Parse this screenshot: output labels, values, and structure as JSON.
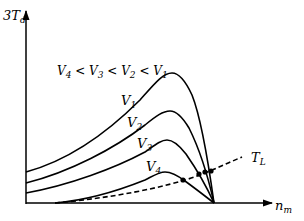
{
  "diagram": {
    "y_axis": {
      "label_main": "3T",
      "label_sub": "d"
    },
    "x_axis": {
      "label_main": "n",
      "label_sub": "m"
    },
    "relation": {
      "parts": [
        "V",
        "4",
        " < ",
        "V",
        "3",
        " < ",
        "V",
        "2",
        " < ",
        "V",
        "1"
      ]
    },
    "curves": [
      {
        "name": "V1",
        "label_main": "V",
        "label_sub": "1",
        "peak_label": "maximum torque highest"
      },
      {
        "name": "V2",
        "label_main": "V",
        "label_sub": "2"
      },
      {
        "name": "V3",
        "label_main": "V",
        "label_sub": "3"
      },
      {
        "name": "V4",
        "label_main": "V",
        "label_sub": "4"
      }
    ],
    "load_curve": {
      "label_main": "T",
      "label_sub": "L",
      "style": "dashed"
    },
    "operating_points_count": 4,
    "colors": {
      "line": "#000000",
      "background": "#ffffff"
    }
  }
}
